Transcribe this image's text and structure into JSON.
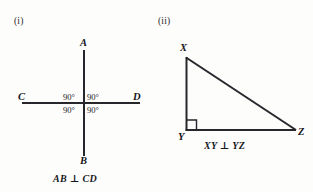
{
  "figure": {
    "background_color": "#fdfdfc",
    "ink_color": "#26262b",
    "figures": [
      {
        "index_label": "(i)",
        "type": "perpendicular-lines",
        "caption": "AB ⊥ CD",
        "endpoint_labels": {
          "top": "A",
          "bottom": "B",
          "left": "C",
          "right": "D"
        },
        "angle_labels": [
          "90°",
          "90°",
          "90°",
          "90°"
        ]
      },
      {
        "index_label": "(ii)",
        "type": "right-triangle",
        "caption": "XY ⊥ YZ",
        "vertex_labels": {
          "apex": "X",
          "right_angle": "Y",
          "base_right": "Z"
        },
        "right_angle_marker": "square"
      }
    ]
  },
  "panel_i": {
    "index": "(i)",
    "label_a": "A",
    "label_b": "B",
    "label_c": "C",
    "label_d": "D",
    "angle_top_left": "90°",
    "angle_top_right": "90°",
    "angle_bottom_left": "90°",
    "angle_bottom_right": "90°",
    "caption": "AB ⊥ CD"
  },
  "panel_ii": {
    "index": "(ii)",
    "label_x": "X",
    "label_y": "Y",
    "label_z": "Z",
    "caption": "XY ⊥ YZ"
  }
}
